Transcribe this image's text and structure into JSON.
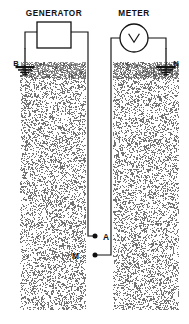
{
  "diagram": {
    "kind": "resistivity-survey-schematic",
    "background_color": "#ffffff",
    "line_color": "#111111",
    "soil_texture": "random-stipple",
    "sources": [
      {
        "name": "generator",
        "label": "GENERATOR",
        "symbol": "rectangle-box",
        "shape": {
          "x": 37,
          "y": 22,
          "w": 34,
          "h": 26
        },
        "label_pos": {
          "x": 54,
          "y": 16
        }
      },
      {
        "name": "meter",
        "label": "METER",
        "symbol": "circle-voltmeter-V",
        "shape": {
          "cx": 134,
          "cy": 38,
          "r": 14
        },
        "label_pos": {
          "x": 134,
          "y": 16
        }
      }
    ],
    "electrodes": [
      {
        "name": "electrode-b",
        "label": "B",
        "type": "ground-rod",
        "label_pos": {
          "x": 16,
          "y": 66
        },
        "rod": {
          "x": 25,
          "y_top": 48,
          "y_bottom": 74
        }
      },
      {
        "name": "electrode-n",
        "label": "N",
        "type": "ground-rod",
        "label_pos": {
          "x": 176,
          "y": 66
        },
        "rod": {
          "x": 166,
          "y_top": 48,
          "y_bottom": 74
        }
      },
      {
        "name": "electrode-a",
        "label": "A",
        "type": "point-node",
        "label_pos": {
          "x": 103,
          "y": 238
        },
        "node": {
          "x": 95,
          "y": 236
        }
      },
      {
        "name": "electrode-m",
        "label": "M",
        "type": "point-node",
        "label_pos": {
          "x": 79,
          "y": 257
        },
        "node": {
          "x": 95,
          "y": 255
        }
      }
    ],
    "soil_columns": [
      {
        "name": "soil-column-left",
        "x": 20,
        "y": 62,
        "w": 66,
        "h": 248
      },
      {
        "name": "soil-column-right",
        "x": 113,
        "y": 62,
        "w": 66,
        "h": 248
      }
    ],
    "wires": [
      {
        "name": "wire-generator-left-to-b",
        "path": "M 25 48 L 25 32 L 37 32"
      },
      {
        "name": "wire-generator-right-to-a",
        "path": "M 71 32 L 88 32 L 88 236 L 95 236"
      },
      {
        "name": "wire-meter-left-to-m",
        "path": "M 120 38 L 111 38 L 111 255 L 95 255"
      },
      {
        "name": "wire-meter-right-to-n",
        "path": "M 148 38 L 166 38 L 166 48"
      }
    ]
  }
}
